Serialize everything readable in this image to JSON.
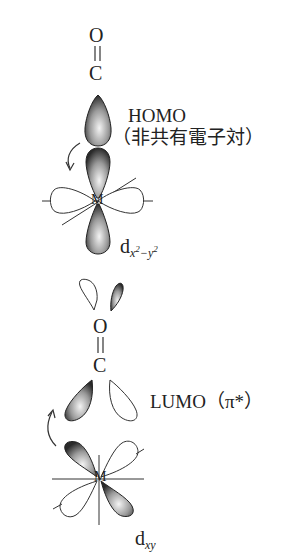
{
  "top": {
    "atom_o": "O",
    "atom_c": "C",
    "bond": "double",
    "homo_label": "HOMO",
    "homo_sub": "（非共有電子対）",
    "metal_label": "M",
    "orbital_base": "d",
    "orbital_sub_x": "x",
    "orbital_sub_x_sup": "2",
    "orbital_sub_minus": "−",
    "orbital_sub_y": "y",
    "orbital_sub_y_sup": "2"
  },
  "bottom": {
    "atom_o": "O",
    "atom_c": "C",
    "bond": "double",
    "lumo_label": "LUMO（π*）",
    "metal_label": "M",
    "orbital_base": "d",
    "orbital_sub": "xy"
  },
  "colors": {
    "ink": "#222222",
    "shade_dark": "#2a2a2a",
    "shade_light": "#f2f2f2",
    "background": "#ffffff"
  }
}
